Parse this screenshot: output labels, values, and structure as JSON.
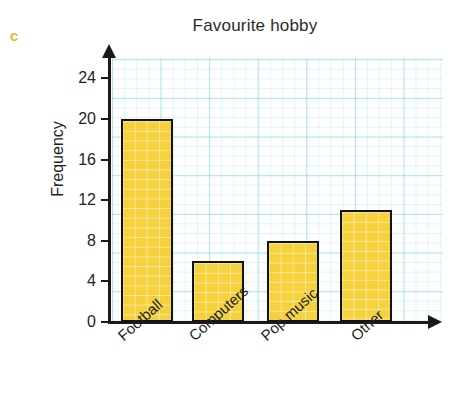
{
  "question_letter": "c",
  "chart_data": {
    "type": "bar",
    "title": "Favourite hobby",
    "xlabel": "",
    "ylabel": "Frequency",
    "categories": [
      "Football",
      "Computers",
      "Pop music",
      "Other"
    ],
    "values": [
      20,
      6,
      8,
      11
    ],
    "ylim": [
      0,
      26
    ],
    "yticks": [
      0,
      4,
      8,
      12,
      16,
      20,
      24
    ],
    "ytick_labels": [
      "0",
      "4",
      "8",
      "12",
      "16",
      "20",
      "24"
    ],
    "grid": true,
    "grid_major_step": 4,
    "grid_minor_step": 1,
    "legend": null,
    "colors": {
      "bar_fill": "#f4d13d",
      "bar_edge": "#111111",
      "grid_line": "#78d2e1",
      "axis": "#1a1a1a",
      "question_letter": "#e8b93a",
      "text": "#231f20"
    }
  }
}
